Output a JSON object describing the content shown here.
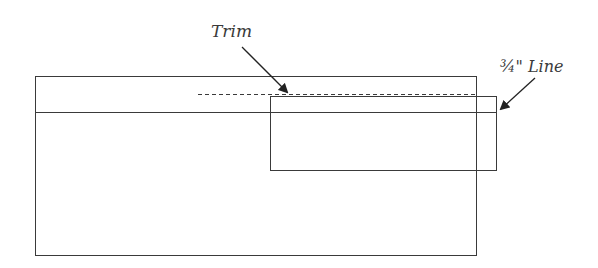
{
  "labels": {
    "trim": "Trim",
    "three_quarter_line": "¾\" Line"
  },
  "colors": {
    "stroke": "#3a3a3a",
    "background": "#ffffff"
  },
  "shapes": {
    "outer_rect": {
      "x": 35,
      "y": 76,
      "width": 441,
      "height": 179
    },
    "horizontal_line": {
      "x1": 35,
      "y1": 112,
      "x2": 496,
      "y2": 112
    },
    "inner_rect": {
      "x": 270,
      "y": 96,
      "width": 226,
      "height": 74
    },
    "trim_dashed_line": {
      "x1": 198,
      "y1": 94,
      "x2": 476,
      "y2": 94
    }
  }
}
